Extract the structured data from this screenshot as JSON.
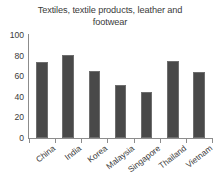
{
  "chart_data": {
    "type": "bar",
    "title": "Textiles, textile products, leather and footwear",
    "xlabel": "",
    "ylabel": "",
    "ylim": [
      0,
      100
    ],
    "yticks": [
      0,
      20,
      40,
      60,
      80,
      100
    ],
    "ytick_labels": [
      "0",
      "20",
      "40",
      "60",
      "80",
      "100"
    ],
    "grid": false,
    "legend": false,
    "bar_color": "#494949",
    "categories": [
      "China",
      "India",
      "Korea",
      "Malaysia",
      "Singapore",
      "Thailand",
      "Vietnam"
    ],
    "values": [
      74,
      81,
      65,
      51,
      45,
      75,
      64
    ]
  }
}
